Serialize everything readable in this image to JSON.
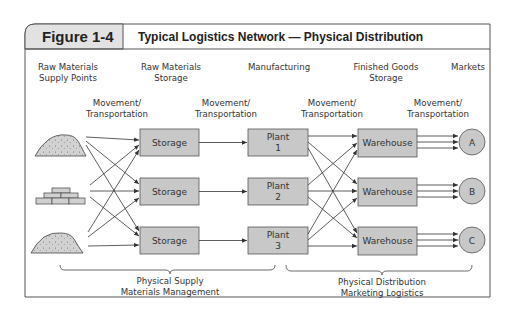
{
  "figure": {
    "number": "Figure 1-4",
    "title": "Typical Logistics Network — Physical Distribution"
  },
  "stages": [
    {
      "line1": "Raw Materials",
      "line2": "Supply Points"
    },
    {
      "line1": "Raw Materials",
      "line2": "Storage"
    },
    {
      "line1": "Manufacturing",
      "line2": ""
    },
    {
      "line1": "Finished Goods",
      "line2": "Storage"
    },
    {
      "line1": "Markets",
      "line2": ""
    }
  ],
  "movement_labels": [
    {
      "line1": "Movement/",
      "line2": "Transportation"
    },
    {
      "line1": "Movement/",
      "line2": "Transportation"
    },
    {
      "line1": "Movement/",
      "line2": "Transportation"
    },
    {
      "line1": "Movement/",
      "line2": "Transportation"
    }
  ],
  "sources": [
    {
      "icon": "raw-material-pile-icon"
    },
    {
      "icon": "brick-stack-icon"
    },
    {
      "icon": "raw-material-pile-icon"
    }
  ],
  "storage_nodes": [
    {
      "label": "Storage"
    },
    {
      "label": "Storage"
    },
    {
      "label": "Storage"
    }
  ],
  "plants": [
    {
      "line1": "Plant",
      "line2": "1"
    },
    {
      "line1": "Plant",
      "line2": "2"
    },
    {
      "line1": "Plant",
      "line2": "3"
    }
  ],
  "warehouses": [
    {
      "label": "Warehouse"
    },
    {
      "label": "Warehouse"
    },
    {
      "label": "Warehouse"
    }
  ],
  "markets": [
    {
      "label": "A"
    },
    {
      "label": "B"
    },
    {
      "label": "C"
    }
  ],
  "brackets": [
    {
      "line1": "Physical Supply",
      "line2": "Materials Management"
    },
    {
      "line1": "Physical Distribution",
      "line2": "Marketing Logistics"
    }
  ],
  "colors": {
    "node_fill": "#c8c8c8",
    "header_tab_fill": "#e2e2e2",
    "line": "#333333"
  }
}
